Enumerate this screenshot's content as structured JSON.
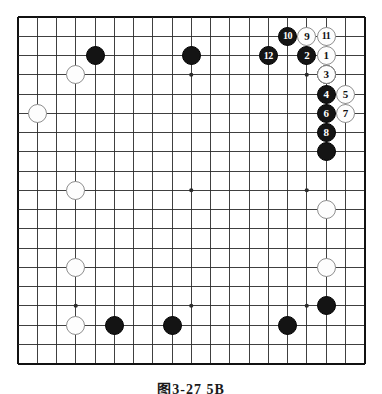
{
  "caption": "图3-27 5B",
  "board": {
    "size": 19,
    "cols": 19,
    "rows": 19,
    "origin_x": 15,
    "origin_y": 14,
    "cell": 19.25,
    "line_color": "#2b2b2b",
    "border_color": "#111111",
    "background": "#ffffff",
    "star_points": [
      {
        "col": 3,
        "row": 3
      },
      {
        "col": 9,
        "row": 3
      },
      {
        "col": 15,
        "row": 3
      },
      {
        "col": 3,
        "row": 9
      },
      {
        "col": 9,
        "row": 9
      },
      {
        "col": 15,
        "row": 9
      },
      {
        "col": 3,
        "row": 15
      },
      {
        "col": 9,
        "row": 15
      },
      {
        "col": 15,
        "row": 15
      }
    ]
  },
  "colors": {
    "black_stone": "#141414",
    "white_stone": "#fdfdfd",
    "white_stone_edge": "#8e8e8e",
    "black_label": "#ffffff",
    "white_label": "#101010"
  },
  "stones": [
    {
      "id": "b-d16",
      "color": "black",
      "col": 4,
      "row": 2,
      "label": ""
    },
    {
      "id": "b-j16",
      "color": "black",
      "col": 9,
      "row": 2,
      "label": ""
    },
    {
      "id": "w-c15",
      "color": "white",
      "col": 3,
      "row": 3,
      "label": ""
    },
    {
      "id": "w-b13",
      "color": "white",
      "col": 1,
      "row": 5,
      "label": ""
    },
    {
      "id": "w-c10",
      "color": "white",
      "col": 3,
      "row": 9,
      "label": ""
    },
    {
      "id": "w-c6",
      "color": "white",
      "col": 3,
      "row": 13,
      "label": ""
    },
    {
      "id": "w-c4",
      "color": "white",
      "col": 3,
      "row": 16,
      "label": ""
    },
    {
      "id": "b-d3",
      "color": "black",
      "col": 5,
      "row": 16,
      "label": ""
    },
    {
      "id": "b-g3",
      "color": "black",
      "col": 8,
      "row": 16,
      "label": ""
    },
    {
      "id": "b-n3",
      "color": "black",
      "col": 14,
      "row": 16,
      "label": ""
    },
    {
      "id": "b-r4",
      "color": "black",
      "col": 16,
      "row": 15,
      "label": ""
    },
    {
      "id": "w-r7",
      "color": "white",
      "col": 16,
      "row": 13,
      "label": ""
    },
    {
      "id": "w-r10",
      "color": "white",
      "col": 16,
      "row": 10,
      "label": ""
    },
    {
      "id": "b-r13",
      "color": "black",
      "col": 16,
      "row": 7,
      "label": ""
    },
    {
      "id": "b-q16",
      "color": "black",
      "col": 16,
      "row": 3,
      "label": ""
    },
    {
      "id": "m10",
      "color": "black",
      "col": 14,
      "row": 1,
      "label": "10"
    },
    {
      "id": "m9",
      "color": "white",
      "col": 15,
      "row": 1,
      "label": "9"
    },
    {
      "id": "m11",
      "color": "white",
      "col": 16,
      "row": 1,
      "label": "11"
    },
    {
      "id": "m12",
      "color": "black",
      "col": 13,
      "row": 2,
      "label": "12"
    },
    {
      "id": "m2",
      "color": "black",
      "col": 15,
      "row": 2,
      "label": "2"
    },
    {
      "id": "m1",
      "color": "white",
      "col": 16,
      "row": 2,
      "label": "1"
    },
    {
      "id": "m3",
      "color": "white",
      "col": 16,
      "row": 3,
      "label": "3"
    },
    {
      "id": "m4",
      "color": "black",
      "col": 16,
      "row": 4,
      "label": "4"
    },
    {
      "id": "m5",
      "color": "white",
      "col": 17,
      "row": 4,
      "label": "5"
    },
    {
      "id": "m6",
      "color": "black",
      "col": 16,
      "row": 5,
      "label": "6"
    },
    {
      "id": "m7",
      "color": "white",
      "col": 17,
      "row": 5,
      "label": "7"
    },
    {
      "id": "m8",
      "color": "black",
      "col": 16,
      "row": 6,
      "label": "8"
    }
  ]
}
